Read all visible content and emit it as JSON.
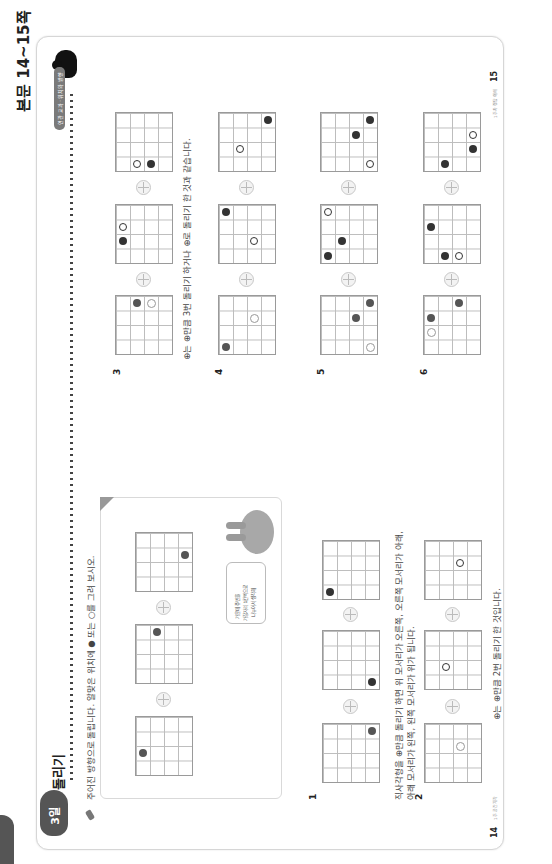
{
  "header": {
    "title": "본문 14~15쪽"
  },
  "page": {
    "day_label": "3일",
    "section_title": "돌리기",
    "tag": "연관 교과 · 위치와 방향",
    "instruction": "주어진 방향으로 돌립니다. 알맞은 위치에 ● 또는 ○를 그려 보시오.",
    "left_page_number": "14",
    "left_footer": "1주 공간지각",
    "right_page_number": "15",
    "right_footer": "1주차 정답 이해"
  },
  "example": {
    "speech_bubble": [
      "가운데 주변을",
      "가장자리 1칸씩으로",
      "나누어서 생각해"
    ],
    "grids": [
      {
        "dots": [
          {
            "c": 3,
            "r": 1,
            "type": "filled-light"
          }
        ]
      },
      {
        "dots": [
          {
            "c": 1,
            "r": 0,
            "type": "filled-light"
          }
        ]
      },
      {
        "dots": [
          {
            "c": 0,
            "r": 2,
            "type": "filled-light"
          }
        ]
      }
    ]
  },
  "explanations": {
    "rect_rotation": "직사각형을 ⊕만큼 돌리기 하면 위 모서리가 오른쪽, 오른쪽 모서리가 아래,",
    "rect_rotation_2": "아래 모서리가 왼쪽, 왼쪽 모서리가 위가 됩니다.",
    "two_half": "⊕는 ⊕만큼 2번 돌리기 한 것입니다.",
    "three_quarter": "⊕는 ⊕만큼 3번 돌리기 하거나 ⊕로 돌리기 한 것과 같습니다."
  },
  "problems": [
    {
      "number": "1",
      "grids": [
        {
          "dots": [
            {
              "c": 3,
              "r": 0,
              "type": "filled-light"
            }
          ]
        },
        {
          "dots": [
            {
              "c": 3,
              "r": 3,
              "type": "filled"
            }
          ]
        },
        {
          "dots": [
            {
              "c": 0,
              "r": 3,
              "type": "filled"
            }
          ]
        }
      ]
    },
    {
      "number": "2",
      "grids": [
        {
          "dots": [
            {
              "c": 2,
              "r": 1,
              "type": "open-light"
            }
          ]
        },
        {
          "dots": [
            {
              "c": 1,
              "r": 2,
              "type": "open"
            }
          ]
        },
        {
          "dots": [
            {
              "c": 2,
              "r": 1,
              "type": "open"
            }
          ]
        }
      ]
    },
    {
      "number": "3",
      "grids": [
        {
          "dots": [
            {
              "c": 1,
              "r": 0,
              "type": "filled-light"
            },
            {
              "c": 2,
              "r": 0,
              "type": "open-light"
            }
          ]
        },
        {
          "dots": [
            {
              "c": 0,
              "r": 1,
              "type": "open"
            },
            {
              "c": 0,
              "r": 2,
              "type": "filled"
            }
          ]
        },
        {
          "dots": [
            {
              "c": 1,
              "r": 3,
              "type": "open"
            },
            {
              "c": 2,
              "r": 3,
              "type": "filled"
            }
          ]
        }
      ]
    },
    {
      "number": "4",
      "grids": [
        {
          "dots": [
            {
              "c": 0,
              "r": 3,
              "type": "filled-light"
            },
            {
              "c": 2,
              "r": 1,
              "type": "open-light"
            }
          ]
        },
        {
          "dots": [
            {
              "c": 0,
              "r": 0,
              "type": "filled"
            },
            {
              "c": 2,
              "r": 2,
              "type": "open"
            }
          ]
        },
        {
          "dots": [
            {
              "c": 3,
              "r": 0,
              "type": "filled"
            },
            {
              "c": 1,
              "r": 2,
              "type": "open"
            }
          ]
        }
      ]
    },
    {
      "number": "5",
      "grids": [
        {
          "dots": [
            {
              "c": 3,
              "r": 0,
              "type": "filled-light"
            },
            {
              "c": 2,
              "r": 1,
              "type": "filled-light"
            },
            {
              "c": 3,
              "r": 3,
              "type": "open-light"
            }
          ]
        },
        {
          "dots": [
            {
              "c": 0,
              "r": 0,
              "type": "open"
            },
            {
              "c": 1,
              "r": 2,
              "type": "filled"
            },
            {
              "c": 0,
              "r": 3,
              "type": "filled"
            }
          ]
        },
        {
          "dots": [
            {
              "c": 3,
              "r": 0,
              "type": "filled"
            },
            {
              "c": 2,
              "r": 1,
              "type": "filled"
            },
            {
              "c": 3,
              "r": 3,
              "type": "open"
            }
          ]
        }
      ]
    },
    {
      "number": "6",
      "grids": [
        {
          "dots": [
            {
              "c": 2,
              "r": 0,
              "type": "filled-light"
            },
            {
              "c": 0,
              "r": 1,
              "type": "filled-light"
            },
            {
              "c": 0,
              "r": 2,
              "type": "open-light"
            }
          ]
        },
        {
          "dots": [
            {
              "c": 0,
              "r": 1,
              "type": "filled"
            },
            {
              "c": 1,
              "r": 3,
              "type": "filled"
            },
            {
              "c": 2,
              "r": 3,
              "type": "open"
            }
          ]
        },
        {
          "dots": [
            {
              "c": 3,
              "r": 1,
              "type": "open"
            },
            {
              "c": 3,
              "r": 2,
              "type": "filled"
            },
            {
              "c": 1,
              "r": 3,
              "type": "filled"
            }
          ]
        }
      ]
    }
  ]
}
